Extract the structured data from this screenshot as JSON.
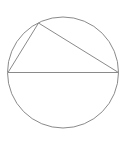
{
  "diagram": {
    "type": "geometry",
    "stroke_color": "#8a8a8a",
    "stroke_width": 1,
    "background": "#ffffff",
    "circle": {
      "cx": 63,
      "cy": 72.5,
      "r": 55.5
    },
    "points": {
      "left": {
        "x": 8,
        "y": 72.5
      },
      "right": {
        "x": 118.5,
        "y": 72.5
      },
      "top": {
        "x": 38.5,
        "y": 23
      }
    },
    "segments": [
      {
        "name": "diameter",
        "from": "left",
        "to": "right"
      },
      {
        "name": "left-chord",
        "from": "left",
        "to": "top"
      },
      {
        "name": "right-chord",
        "from": "top",
        "to": "right"
      }
    ]
  }
}
